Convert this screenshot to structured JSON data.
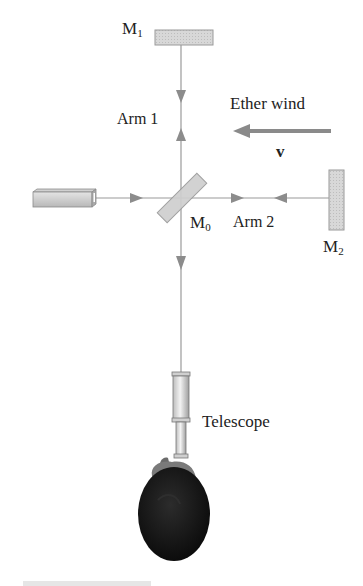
{
  "diagram": {
    "labels": {
      "m1_main": "M",
      "m1_sub": "1",
      "m0_main": "M",
      "m0_sub": "0",
      "m2_main": "M",
      "m2_sub": "2",
      "arm1": "Arm 1",
      "arm2": "Arm 2",
      "ether_wind": "Ether wind",
      "velocity": "v",
      "telescope": "Telescope"
    },
    "components": [
      "light-source",
      "beam-splitter-M0",
      "mirror-M1",
      "mirror-M2",
      "telescope",
      "observer-head"
    ],
    "colors": {
      "beam": "#9a9a9a",
      "arrowhead": "#8c8c8c",
      "mirror_fill": "#d4d4d4",
      "ether_arrow": "#8a8a8a",
      "head": "#141414"
    }
  }
}
